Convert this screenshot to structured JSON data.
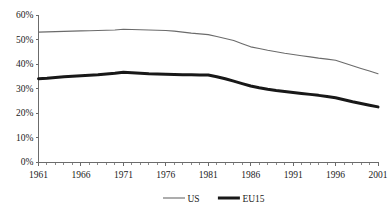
{
  "chart_data": {
    "type": "line",
    "title": "",
    "subtitle": "",
    "xlabel": "",
    "ylabel": "",
    "x": [
      1961,
      1962,
      1963,
      1964,
      1965,
      1966,
      1967,
      1968,
      1969,
      1970,
      1971,
      1972,
      1973,
      1974,
      1975,
      1976,
      1977,
      1978,
      1979,
      1980,
      1981,
      1982,
      1983,
      1984,
      1985,
      1986,
      1987,
      1988,
      1989,
      1990,
      1991,
      1992,
      1993,
      1994,
      1995,
      1996,
      1997,
      1998,
      1999,
      2000,
      2001
    ],
    "xlim": [
      1961,
      2001
    ],
    "ylim": [
      0,
      60
    ],
    "grid": false,
    "legend_position": "bottom",
    "x_tick_labels": [
      "1961",
      "1966",
      "1971",
      "1976",
      "1981",
      "1986",
      "1991",
      "1996",
      "2001"
    ],
    "x_tick_values": [
      1961,
      1966,
      1971,
      1976,
      1981,
      1986,
      1991,
      1996,
      2001
    ],
    "y_tick_labels": [
      "0%",
      "10%",
      "20%",
      "30%",
      "40%",
      "50%",
      "60%"
    ],
    "y_tick_values": [
      0,
      10,
      20,
      30,
      40,
      50,
      60
    ],
    "minor_x_ticks": true,
    "series": [
      {
        "name": "US",
        "color": "#6b6b6b",
        "width": 1.1,
        "values": [
          53.0,
          53.1,
          53.2,
          53.3,
          53.4,
          53.5,
          53.6,
          53.7,
          53.8,
          53.9,
          54.2,
          54.1,
          54.0,
          53.9,
          53.8,
          53.7,
          53.4,
          53.0,
          52.6,
          52.3,
          52.0,
          51.2,
          50.4,
          49.6,
          48.3,
          47.0,
          46.3,
          45.6,
          45.0,
          44.4,
          43.9,
          43.4,
          42.9,
          42.4,
          42.0,
          41.5,
          40.4,
          39.3,
          38.2,
          37.1,
          36.0
        ]
      },
      {
        "name": "EU15",
        "color": "#181818",
        "width": 3.0,
        "values": [
          34.0,
          34.2,
          34.5,
          34.8,
          35.0,
          35.2,
          35.4,
          35.6,
          35.9,
          36.2,
          36.6,
          36.4,
          36.2,
          36.0,
          35.9,
          35.8,
          35.7,
          35.6,
          35.6,
          35.5,
          35.5,
          34.8,
          34.0,
          33.0,
          32.0,
          31.0,
          30.3,
          29.7,
          29.2,
          28.8,
          28.4,
          28.0,
          27.6,
          27.2,
          26.7,
          26.2,
          25.4,
          24.6,
          23.9,
          23.2,
          22.5
        ]
      }
    ],
    "legend": [
      {
        "label": "US",
        "color": "#6b6b6b",
        "width": 1.1
      },
      {
        "label": "EU15",
        "color": "#181818",
        "width": 3.0
      }
    ]
  }
}
